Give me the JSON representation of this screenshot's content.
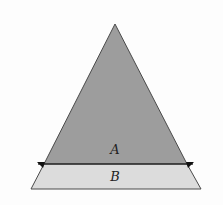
{
  "diagram": {
    "regions": [
      {
        "id": "A",
        "label": "A",
        "shape": "triangle",
        "fill": "#9d9d9d"
      },
      {
        "id": "B",
        "label": "B",
        "shape": "trapezoid",
        "fill": "#dcdcdc"
      }
    ],
    "stroke": "#4a4a4a",
    "background": "#fdfdfd"
  }
}
